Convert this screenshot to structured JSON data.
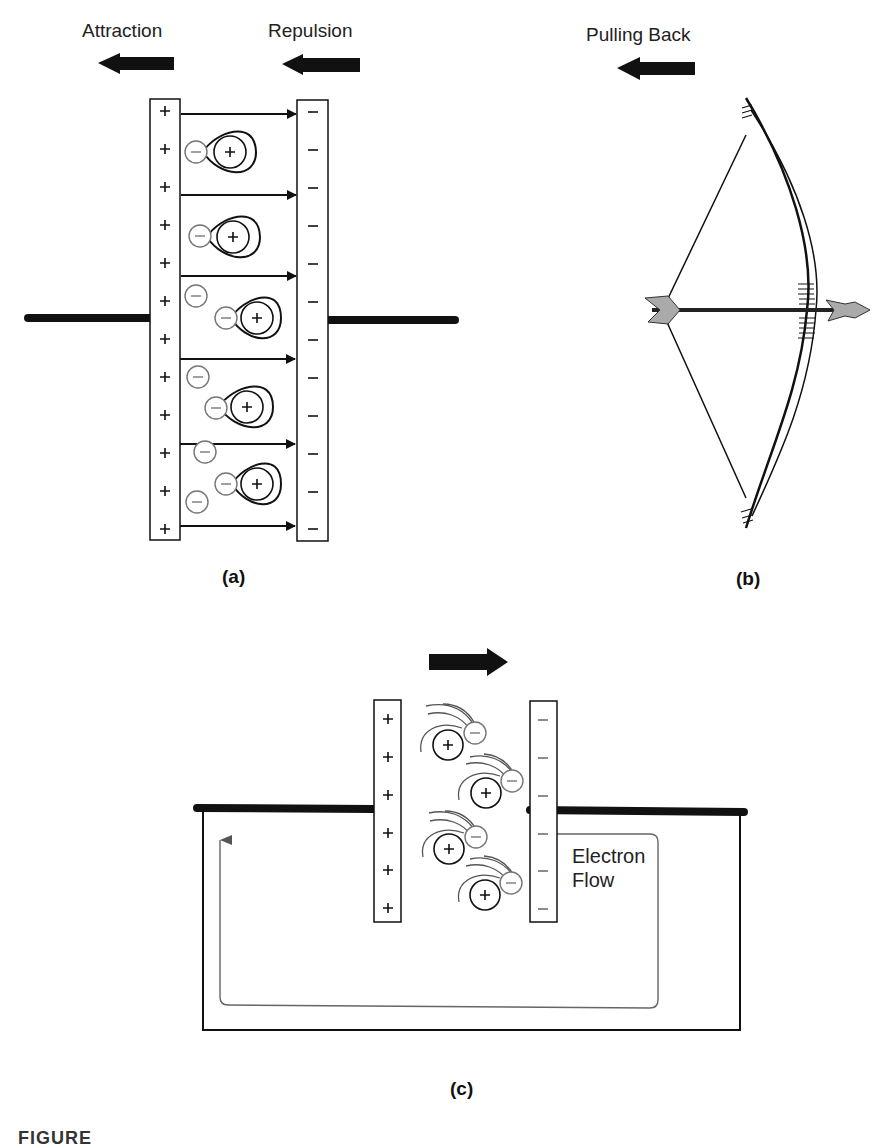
{
  "figure": {
    "panel_a": {
      "label": "(a)",
      "arrow_labels": {
        "left": "Attraction",
        "right": "Repulsion"
      },
      "positive_plate": {
        "sign": "+",
        "count": 12
      },
      "negative_plate": {
        "sign": "−",
        "count": 12
      },
      "field_arrows": 6,
      "distorted_atoms": 5,
      "free_electrons": 4
    },
    "panel_b": {
      "label": "(b)",
      "arrow_label": "Pulling Back",
      "illustration": "bow-and-arrow"
    },
    "panel_c": {
      "label": "(c)",
      "direction_arrow": "right",
      "positive_plate": {
        "sign": "+",
        "count": 6
      },
      "negative_plate": {
        "sign": "−",
        "count": 6
      },
      "atoms": 4,
      "flow_label_line1": "Electron",
      "flow_label_line2": "Flow"
    },
    "caption_visible": "FIGURE"
  },
  "colors": {
    "ink": "#111111",
    "grey_ink": "#666666",
    "paper": "#ffffff"
  }
}
